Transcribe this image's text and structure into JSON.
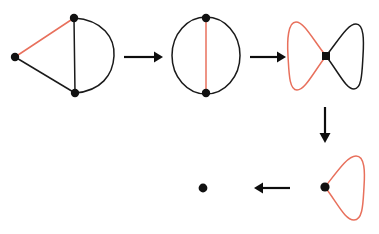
{
  "figure": {
    "title": "Graph reduction sequence",
    "background_color": "#ffffff",
    "width": 379,
    "height": 234,
    "colors": {
      "edge_black": "#1a1a1a",
      "edge_red": "#e8705c",
      "vertex": "#111111",
      "arrow": "#0d0d0d"
    },
    "caption": ""
  },
  "steps": [
    {
      "id": "step-1",
      "name": "theta-graph-with-pendant-triangle",
      "label": "",
      "vertices": [
        {
          "name": "left-vertex",
          "x": 15,
          "y": 57
        },
        {
          "name": "top-vertex",
          "x": 74,
          "y": 18
        },
        {
          "name": "bottom-vertex",
          "x": 75,
          "y": 93
        }
      ],
      "edges": [
        {
          "name": "left-to-top-edge",
          "color": "red",
          "kind": "straight"
        },
        {
          "name": "left-to-bottom-edge",
          "color": "black",
          "kind": "straight"
        },
        {
          "name": "vertical-chord-edge",
          "color": "black",
          "kind": "straight"
        },
        {
          "name": "right-arc-edge",
          "color": "black",
          "kind": "arc"
        }
      ]
    },
    {
      "id": "step-2",
      "name": "circle-with-red-chord",
      "label": "",
      "vertices": [
        {
          "name": "top-vertex",
          "x": 206,
          "y": 18
        },
        {
          "name": "bottom-vertex",
          "x": 206,
          "y": 93
        }
      ],
      "edges": [
        {
          "name": "left-arc-edge",
          "color": "black",
          "kind": "arc"
        },
        {
          "name": "right-arc-edge",
          "color": "black",
          "kind": "arc"
        },
        {
          "name": "vertical-chord-edge",
          "color": "red",
          "kind": "straight"
        }
      ]
    },
    {
      "id": "step-3",
      "name": "bowtie-two-loops",
      "label": "",
      "vertices": [
        {
          "name": "center-vertex",
          "x": 326,
          "y": 56
        }
      ],
      "edges": [
        {
          "name": "left-loop-edge",
          "color": "red",
          "kind": "loop"
        },
        {
          "name": "right-loop-edge",
          "color": "black",
          "kind": "loop"
        }
      ]
    },
    {
      "id": "step-4",
      "name": "single-red-loop",
      "label": "",
      "vertices": [
        {
          "name": "loop-vertex",
          "x": 325,
          "y": 187
        }
      ],
      "edges": [
        {
          "name": "red-loop-edge",
          "color": "red",
          "kind": "loop"
        }
      ]
    },
    {
      "id": "step-5",
      "name": "single-vertex",
      "label": "",
      "vertices": [
        {
          "name": "isolated-vertex",
          "x": 203,
          "y": 188
        }
      ],
      "edges": []
    }
  ],
  "arrows": [
    {
      "id": "arrow-1",
      "name": "arrow-right-step1-to-step2",
      "direction": "right",
      "x1": 124,
      "y1": 57,
      "x2": 162,
      "y2": 57,
      "label": ""
    },
    {
      "id": "arrow-2",
      "name": "arrow-right-step2-to-step3",
      "direction": "right",
      "x1": 250,
      "y1": 57,
      "x2": 286,
      "y2": 57,
      "label": ""
    },
    {
      "id": "arrow-3",
      "name": "arrow-down-step3-to-step4",
      "direction": "down",
      "x1": 325,
      "y1": 107,
      "x2": 325,
      "y2": 142,
      "label": ""
    },
    {
      "id": "arrow-4",
      "name": "arrow-left-step4-to-step5",
      "direction": "left",
      "x1": 290,
      "y1": 188,
      "x2": 254,
      "y2": 188,
      "label": ""
    }
  ]
}
